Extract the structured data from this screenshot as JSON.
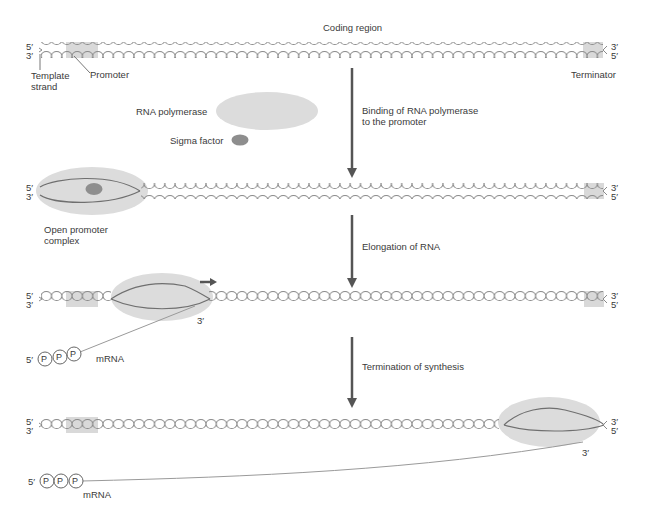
{
  "labels": {
    "coding_region": "Coding region",
    "template_strand": "Template\nstrand",
    "promoter": "Promoter",
    "terminator": "Terminator",
    "rna_polymerase": "RNA polymerase",
    "sigma_factor": "Sigma factor",
    "open_promoter_complex": "Open promoter\ncomplex",
    "mrna": "mRNA",
    "five_prime": "5′",
    "three_prime": "3′",
    "phosphate": "P"
  },
  "steps": [
    {
      "label": "Binding of RNA polymerase\nto the promoter"
    },
    {
      "label": "Elongation of RNA"
    },
    {
      "label": "Termination of synthesis"
    }
  ],
  "colors": {
    "strand": "#8a8a8a",
    "highlight": "#d9d9d9",
    "polymerase": "#dcdcdc",
    "sigma": "#8e8e8e",
    "arrow": "#555555",
    "rna": "#9a9a9a"
  }
}
